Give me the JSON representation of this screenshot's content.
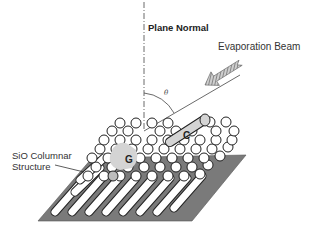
{
  "labels": {
    "plane_normal": "Plane Normal",
    "evaporation_beam": "Evaporation Beam",
    "theta": "θ",
    "sio_line1": "SiO Columnar",
    "sio_line2": "Structure",
    "c": "C",
    "g": "G"
  },
  "colors": {
    "substrate": "#7a7a7a",
    "column_fill": "#ffffff",
    "column_stroke": "#222222",
    "highlight": "#d4d4d4",
    "arrow_hatch": "#888888"
  }
}
